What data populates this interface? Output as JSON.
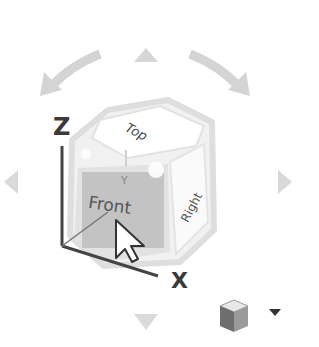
{
  "viewcube": {
    "faces": {
      "top": "Top",
      "front": "Front",
      "right": "Right"
    },
    "axes": {
      "z": "Z",
      "x": "X",
      "y": "Y"
    },
    "nav_arrows": [
      "up-arrow",
      "down-arrow",
      "left-arrow",
      "right-arrow",
      "rotate-ccw-arrow",
      "rotate-cw-arrow"
    ],
    "active_face": "Front"
  },
  "menu": {
    "icon": "home-cube-icon",
    "dropdown": "chevron-down-icon"
  },
  "colors": {
    "arrow": "#d0d0d0",
    "cube_edge": "#e0e0e0",
    "front_face": "#a8a8a8",
    "axis": "#444444",
    "text": "#555555"
  }
}
